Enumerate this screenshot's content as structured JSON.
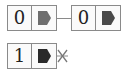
{
  "diagram": {
    "type": "linked-list",
    "lists": [
      {
        "nodes": [
          {
            "value": "0",
            "pointer_color": "#6e6e6e"
          },
          {
            "value": "0",
            "pointer_color": "#4a4a4a"
          }
        ],
        "terminates": "none"
      },
      {
        "nodes": [
          {
            "value": "1",
            "pointer_color": "#2a2a2a"
          }
        ],
        "terminates": "null"
      }
    ],
    "colors": {
      "border": "#8a8a8a",
      "connector": "#8a8a8a",
      "null_mark": "#777777"
    }
  }
}
